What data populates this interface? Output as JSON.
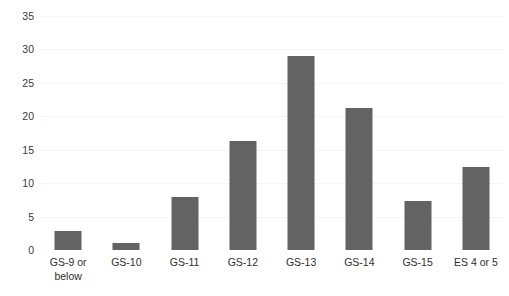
{
  "chart_data": {
    "type": "bar",
    "title": "",
    "subtitle": "",
    "xlabel": "",
    "ylabel": "",
    "categories": [
      "GS-9 or below",
      "GS-10",
      "GS-11",
      "GS-12",
      "GS-13",
      "GS-14",
      "GS-15",
      "ES 4 or 5"
    ],
    "category_labels_wrapped": [
      "GS-9 or\nbelow",
      "GS-10",
      "GS-11",
      "GS-12",
      "GS-13",
      "GS-14",
      "GS-15",
      "ES 4 or 5"
    ],
    "values": [
      2.8,
      1.0,
      8.0,
      16.3,
      29.0,
      21.3,
      7.4,
      12.4
    ],
    "ylim": [
      0,
      35
    ],
    "yticks": [
      0,
      5,
      10,
      15,
      20,
      25,
      30,
      35
    ],
    "ytick_labels": [
      "0",
      "5",
      "10",
      "15",
      "20",
      "25",
      "30",
      "35"
    ],
    "grid": true,
    "grid_axis": "y",
    "legend": false,
    "legend_position": "none",
    "bar_color": "#636363",
    "gridline_color": "#f4f4f4",
    "background_color": "#ffffff",
    "text_color": "#2f2f2f"
  }
}
